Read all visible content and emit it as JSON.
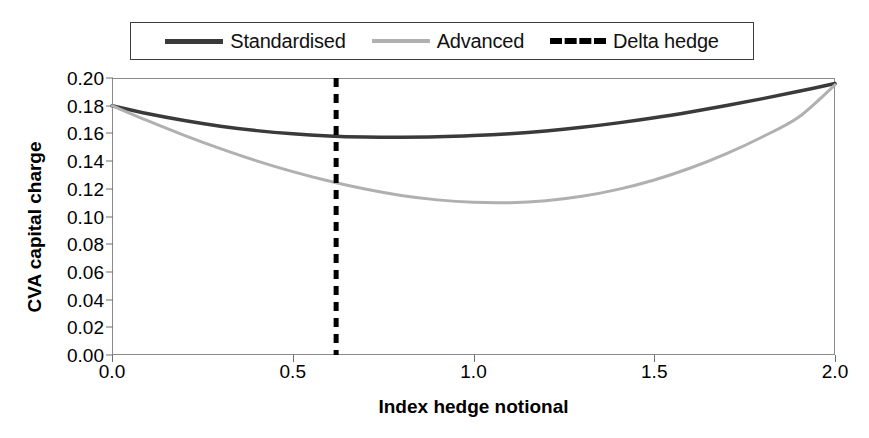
{
  "chart_data": {
    "type": "line",
    "title": "",
    "xlabel": "Index hedge notional",
    "ylabel": "CVA capital charge",
    "xlim": [
      0.0,
      2.0
    ],
    "ylim": [
      0.0,
      0.2
    ],
    "grid": false,
    "legend_position": "top-center",
    "xticks": [
      "0.0",
      "0.5",
      "1.0",
      "1.5",
      "2.0"
    ],
    "xtick_values": [
      0.0,
      0.5,
      1.0,
      1.5,
      2.0
    ],
    "yticks": [
      "0.00",
      "0.02",
      "0.04",
      "0.06",
      "0.08",
      "0.10",
      "0.12",
      "0.14",
      "0.16",
      "0.18",
      "0.20"
    ],
    "ytick_values": [
      0.0,
      0.02,
      0.04,
      0.06,
      0.08,
      0.1,
      0.12,
      0.14,
      0.16,
      0.18,
      0.2
    ],
    "x": [
      0.0,
      0.1,
      0.2,
      0.3,
      0.4,
      0.5,
      0.6,
      0.7,
      0.8,
      0.9,
      1.0,
      1.1,
      1.2,
      1.3,
      1.4,
      1.5,
      1.6,
      1.7,
      1.8,
      1.9,
      2.0
    ],
    "series": [
      {
        "name": "Standardised",
        "color": "#3a3a3a",
        "style": "solid",
        "width": 3.5,
        "values": [
          0.18,
          0.1742,
          0.1693,
          0.1652,
          0.162,
          0.1597,
          0.1582,
          0.1574,
          0.1572,
          0.1575,
          0.1584,
          0.1598,
          0.1618,
          0.1644,
          0.1676,
          0.1713,
          0.1755,
          0.1801,
          0.1851,
          0.1904,
          0.196
        ],
        "min_value": 0.1572,
        "min_at_x": 0.8,
        "value_at_delta_hedge": 0.1582
      },
      {
        "name": "Advanced",
        "color": "#b0b0b0",
        "style": "solid",
        "width": 3.0,
        "values": [
          0.18,
          0.169,
          0.1586,
          0.149,
          0.1402,
          0.1324,
          0.1256,
          0.1198,
          0.1152,
          0.112,
          0.1102,
          0.11,
          0.1114,
          0.1146,
          0.1196,
          0.1264,
          0.135,
          0.1454,
          0.1576,
          0.1718,
          0.195
        ],
        "min_value": 0.11,
        "min_at_x": 1.05,
        "value_at_delta_hedge": 0.1256
      }
    ],
    "annotations": [
      {
        "name": "Delta hedge",
        "type": "vertical-line",
        "x": 0.62,
        "color": "#000000",
        "style": "dashed",
        "width": 5
      }
    ],
    "legend": [
      {
        "label": "Standardised",
        "swatch": "solid-dark"
      },
      {
        "label": "Advanced",
        "swatch": "solid-light"
      },
      {
        "label": "Delta hedge",
        "swatch": "dashed-black"
      }
    ]
  },
  "colors": {
    "standardised": "#3a3a3a",
    "advanced": "#b0b0b0",
    "delta_hedge": "#000000",
    "axis": "#8a8a8a",
    "background": "#ffffff"
  }
}
